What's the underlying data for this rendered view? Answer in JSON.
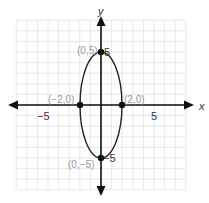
{
  "chart_data": {
    "type": "line",
    "title": "",
    "xlabel": "x",
    "ylabel": "y",
    "xlim": [
      -8,
      8
    ],
    "ylim": [
      -8,
      8
    ],
    "grid": true,
    "x_ticks_labeled": [
      -5,
      5
    ],
    "y_ticks_labeled": [
      5,
      -5
    ],
    "curve": {
      "kind": "ellipse",
      "center": [
        0,
        0
      ],
      "semi_axis_x": 2,
      "semi_axis_y": 5,
      "equation": "x^2/4 + y^2/25 = 1"
    },
    "points": [
      {
        "x": 0,
        "y": 5,
        "label": "(0,5)"
      },
      {
        "x": 0,
        "y": -5,
        "label": "(0,−5)"
      },
      {
        "x": -2,
        "y": 0,
        "label": "(−2,0)"
      },
      {
        "x": 2,
        "y": 0,
        "label": "(2,0)"
      }
    ]
  },
  "labels": {
    "x_axis": "x",
    "y_axis": "y",
    "x_neg5": "−5",
    "x_pos5": "5",
    "y_pos5": "5",
    "y_neg5": "−5",
    "pt_top": "(0,5)",
    "pt_bottom": "(0,−5)",
    "pt_left": "(−2,0)",
    "pt_right": "(2,0)"
  },
  "colors": {
    "grid": "#e2e2e2",
    "axis": "#111111",
    "curve": "#222222",
    "point_label": "#9a9a9a",
    "tick_label": "#333333"
  }
}
